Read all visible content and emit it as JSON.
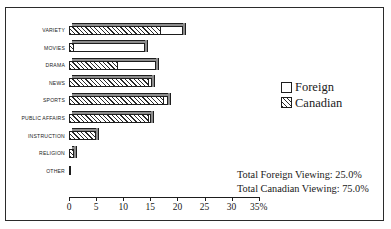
{
  "chart_data": {
    "type": "bar",
    "orientation": "horizontal",
    "stacked": true,
    "title": "",
    "xlabel": "",
    "ylabel": "",
    "xlim": [
      0,
      35
    ],
    "xticks": [
      0,
      5,
      10,
      15,
      20,
      25,
      30,
      35
    ],
    "xticklabels": [
      "0",
      "5",
      "10",
      "15",
      "20",
      "25",
      "30",
      "35%"
    ],
    "grid": false,
    "legend_position": "right",
    "categories": [
      "VARIETY",
      "MOVIES",
      "DRAMA",
      "NEWS",
      "SPORTS",
      "PUBLIC AFFAIRS",
      "INSTRUCTION",
      "RELIGION",
      "OTHER"
    ],
    "series": [
      {
        "name": "Canadian",
        "values": [
          17.0,
          1.0,
          9.0,
          14.7,
          17.6,
          14.8,
          5.0,
          1.0,
          0.2
        ]
      },
      {
        "name": "Foreign",
        "values": [
          4.0,
          13.0,
          7.0,
          0.6,
          0.6,
          0.3,
          0.0,
          0.0,
          0.0
        ]
      }
    ],
    "totals": [
      21.0,
      14.0,
      16.0,
      15.3,
      18.2,
      15.1,
      5.0,
      1.0,
      0.2
    ],
    "annotations": [
      "Total Foreign Viewing: 25.0%",
      "Total Canadian Viewing: 75.0%"
    ]
  },
  "legend": {
    "items": [
      {
        "label": "Foreign",
        "swatch": "white-square",
        "color": "#ffffff"
      },
      {
        "label": "Canadian",
        "swatch": "hatched-square",
        "color": "#2a2a2a"
      }
    ]
  },
  "totals_block": {
    "foreign_line": "Total Foreign Viewing: 25.0%",
    "canadian_line": "Total Canadian Viewing: 75.0%"
  }
}
